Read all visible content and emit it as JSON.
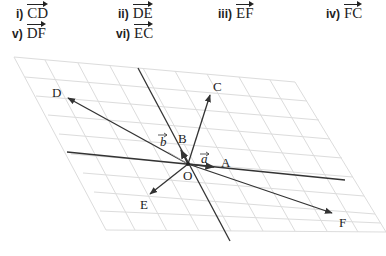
{
  "questions": [
    {
      "num": "i)",
      "vector": "CD"
    },
    {
      "num": "ii)",
      "vector": "DE"
    },
    {
      "num": "iii)",
      "vector": "EF"
    },
    {
      "num": "iv)",
      "vector": "FC"
    },
    {
      "num": "v)",
      "vector": "DF"
    },
    {
      "num": "vi)",
      "vector": "EC"
    }
  ],
  "figure": {
    "points": {
      "O": "O",
      "A": "A",
      "B": "B",
      "C": "C",
      "D": "D",
      "E": "E",
      "F": "F"
    },
    "vectors": {
      "a": "a",
      "b": "b"
    },
    "colors": {
      "grid": "#dcdcdc",
      "line": "#333333"
    }
  }
}
